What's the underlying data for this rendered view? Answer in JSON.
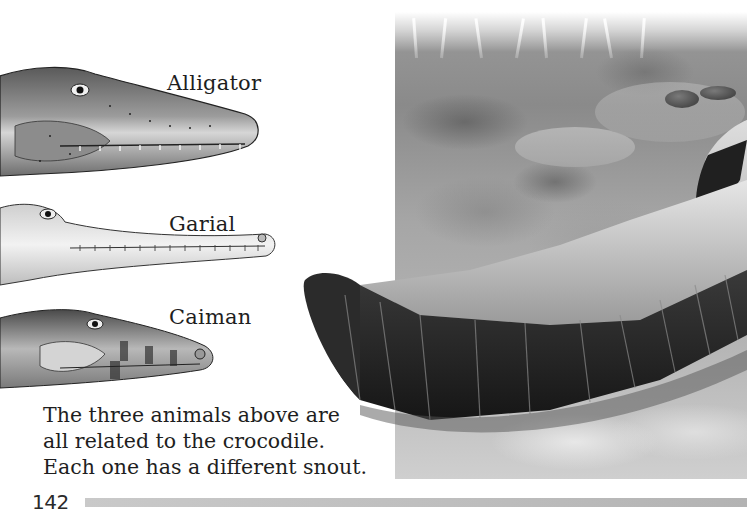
{
  "page": {
    "number": "142",
    "background_color": "#ffffff",
    "rule_color": "#bdbdbd"
  },
  "illustrations": {
    "heads": [
      {
        "id": "alligator",
        "label": "Alligator"
      },
      {
        "id": "garial",
        "label": "Garial"
      },
      {
        "id": "caiman",
        "label": "Caiman"
      }
    ],
    "scene": {
      "subject": "crocodile-tail-on-riverbank",
      "style": "grayscale painting"
    }
  },
  "caption": {
    "lines": [
      "The three animals above are",
      "all related to the crocodile.",
      "Each one has a different snout."
    ]
  }
}
